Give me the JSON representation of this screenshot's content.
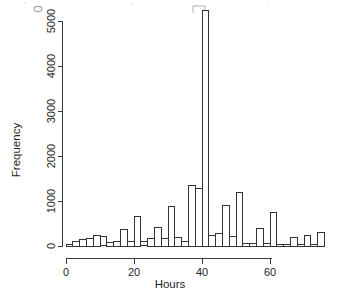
{
  "figure": {
    "background_color": "#ffffff",
    "ink_color": "#333333",
    "type": "histogram-figure"
  },
  "chart_data": {
    "type": "bar",
    "title": "",
    "subtitle": "",
    "xlabel": "Hours",
    "ylabel": "Frequency",
    "xlim": [
      0,
      75
    ],
    "ylim": [
      0,
      5300
    ],
    "grid": false,
    "legend": null,
    "bin_width": 2,
    "x_ticks": [
      0,
      20,
      40,
      60
    ],
    "x_tick_labels": [
      "0",
      "20",
      "40",
      "60"
    ],
    "y_ticks": [
      0,
      1000,
      2000,
      3000,
      4000,
      5000
    ],
    "y_tick_labels": [
      "0",
      "1000",
      "2000",
      "3000",
      "4000",
      "5000"
    ],
    "bin_starts": [
      0,
      2,
      4,
      6,
      8,
      10,
      12,
      14,
      16,
      18,
      20,
      22,
      24,
      26,
      28,
      30,
      32,
      34,
      36,
      38,
      40,
      42,
      44,
      46,
      48,
      50,
      52,
      54,
      56,
      58,
      60,
      62,
      64,
      66,
      68,
      70,
      72,
      74
    ],
    "categories": [
      "0-2",
      "2-4",
      "4-6",
      "6-8",
      "8-10",
      "10-12",
      "12-14",
      "14-16",
      "16-18",
      "18-20",
      "20-22",
      "22-24",
      "24-26",
      "26-28",
      "28-30",
      "30-32",
      "32-34",
      "34-36",
      "36-38",
      "38-40",
      "40-42",
      "42-44",
      "44-46",
      "46-48",
      "48-50",
      "50-52",
      "52-54",
      "54-56",
      "56-58",
      "58-60",
      "60-62",
      "62-64",
      "64-66",
      "66-68",
      "68-70",
      "70-72",
      "72-74",
      "74-76"
    ],
    "values": [
      40,
      110,
      150,
      175,
      230,
      215,
      70,
      100,
      370,
      110,
      650,
      95,
      175,
      420,
      175,
      880,
      200,
      105,
      1340,
      1280,
      5230,
      230,
      275,
      890,
      220,
      1190,
      60,
      55,
      400,
      50,
      750,
      30,
      30,
      180,
      30,
      240,
      40,
      290
    ],
    "peak": {
      "bin": "40-42",
      "value": 5230,
      "note": "dominant spike just above 40 hours"
    }
  },
  "axes": {
    "x_axis_name": "hours-axis",
    "y_axis_name": "frequency-axis",
    "x_title": "Hours",
    "y_title": "Frequency"
  },
  "artifacts": {
    "description": "faint scanner bleed-through marks near top of page",
    "marks": [
      "small-oval",
      "small-square"
    ]
  }
}
